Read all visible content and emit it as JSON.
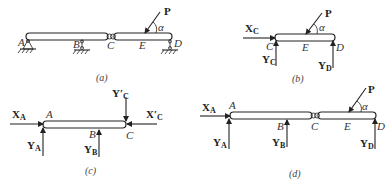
{
  "figure": {
    "panels": [
      {
        "id": "a",
        "caption": "(a)",
        "points": [
          "A",
          "B",
          "C",
          "E",
          "D"
        ],
        "force": "P",
        "angle": "α"
      },
      {
        "id": "b",
        "caption": "(b)",
        "points": [
          "C",
          "E",
          "D"
        ],
        "force": "P",
        "angle": "α",
        "reactions": {
          "xc": "X",
          "xc_sub": "C",
          "yc": "Y",
          "yc_sub": "C",
          "yd": "Y",
          "yd_sub": "D"
        }
      },
      {
        "id": "c",
        "caption": "(c)",
        "points": [
          "A",
          "B",
          "C"
        ],
        "reactions": {
          "xa": "X",
          "xa_sub": "A",
          "ya": "Y",
          "ya_sub": "A",
          "yb": "Y",
          "yb_sub": "B",
          "yc_prime": "Y′",
          "yc_prime_sub": "C",
          "xc_prime": "X′",
          "xc_prime_sub": "C"
        }
      },
      {
        "id": "d",
        "caption": "(d)",
        "points": [
          "A",
          "B",
          "C",
          "E",
          "D"
        ],
        "force": "P",
        "angle": "α",
        "reactions": {
          "xa": "X",
          "xa_sub": "A",
          "ya": "Y",
          "ya_sub": "A",
          "yb": "Y",
          "yb_sub": "B",
          "yd": "Y",
          "yd_sub": "D"
        }
      }
    ]
  }
}
